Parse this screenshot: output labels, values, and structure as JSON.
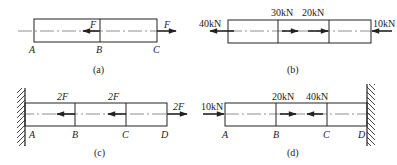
{
  "panels": [
    {
      "id": "a",
      "caption": "(a)",
      "points": [
        "A",
        "B",
        "C"
      ],
      "forces": [
        {
          "at": "B",
          "label": "F",
          "direction": "left"
        },
        {
          "at": "C",
          "label": "F",
          "direction": "right"
        }
      ],
      "support": "none"
    },
    {
      "id": "b",
      "caption": "(b)",
      "points": [],
      "forces": [
        {
          "at": "left-end",
          "label": "40kN",
          "direction": "left"
        },
        {
          "at": "section-1",
          "label": "30kN",
          "direction": "right"
        },
        {
          "at": "section-2",
          "label": "20kN",
          "direction": "right"
        },
        {
          "at": "right-end",
          "label": "10kN",
          "direction": "left"
        }
      ],
      "support": "none"
    },
    {
      "id": "c",
      "caption": "(c)",
      "points": [
        "A",
        "B",
        "C",
        "D"
      ],
      "forces": [
        {
          "at": "B",
          "label": "2F",
          "direction": "left"
        },
        {
          "at": "C",
          "label": "2F",
          "direction": "left"
        },
        {
          "at": "D",
          "label": "2F",
          "direction": "right"
        }
      ],
      "support": "fixed-wall-left"
    },
    {
      "id": "d",
      "caption": "(d)",
      "points": [
        "A",
        "B",
        "C",
        "D"
      ],
      "forces": [
        {
          "at": "A",
          "label": "10kN",
          "direction": "right"
        },
        {
          "at": "B",
          "label": "20kN",
          "direction": "right"
        },
        {
          "at": "C",
          "label": "40kN",
          "direction": "left"
        }
      ],
      "support": "fixed-wall-right"
    }
  ]
}
